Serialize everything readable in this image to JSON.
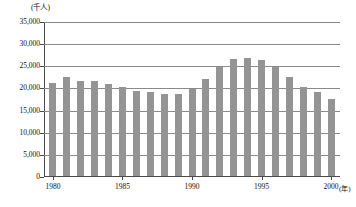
{
  "chart_data": {
    "type": "bar",
    "title": "",
    "subtitle": "",
    "xlabel": "(年)",
    "ylabel": "(千人)",
    "unit_y": "(千人)",
    "unit_x": "(年)",
    "grid": true,
    "legend": "none",
    "bar_color": "#949494",
    "axis_color": "#4a4a4a",
    "grid_color": "#8a8a8a",
    "ylim": [
      0,
      35000
    ],
    "yticks": [
      0,
      5000,
      10000,
      15000,
      20000,
      25000,
      30000,
      35000
    ],
    "ytick_labels": [
      "0",
      "5,000",
      "10,000",
      "15,000",
      "20,000",
      "25,000",
      "30,000",
      "35,000"
    ],
    "xticks": [
      1980,
      1985,
      1990,
      1995,
      2000
    ],
    "xtick_labels": [
      "1980",
      "1985",
      "1990",
      "1995",
      "2000"
    ],
    "categories": [
      "1980",
      "1981",
      "1982",
      "1983",
      "1984",
      "1985",
      "1986",
      "1987",
      "1988",
      "1989",
      "1990",
      "1991",
      "1992",
      "1993",
      "1994",
      "1995",
      "1996",
      "1997",
      "1998",
      "1999",
      "2000"
    ],
    "values": [
      20900,
      22300,
      21400,
      21400,
      20700,
      20000,
      19300,
      19000,
      18600,
      18600,
      19700,
      21900,
      24600,
      26400,
      26600,
      26100,
      24600,
      22400,
      20000,
      18900,
      17300
    ]
  }
}
